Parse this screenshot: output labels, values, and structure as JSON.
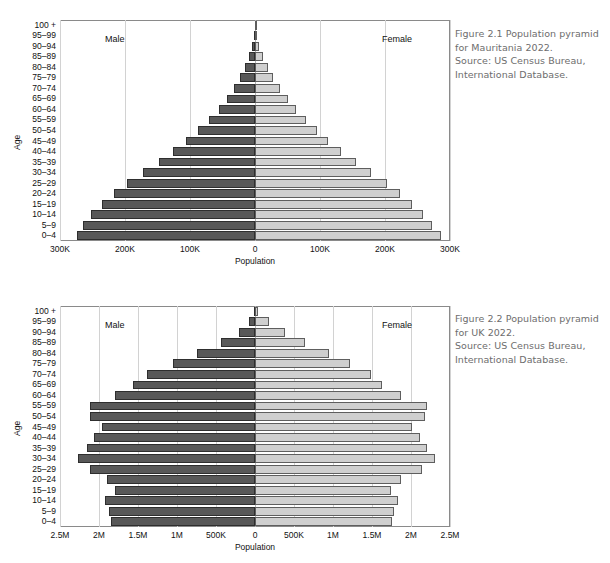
{
  "figures": [
    {
      "id": "figure-1",
      "caption_lines": [
        "Figure 2.1  Population pyramid",
        "for Mauritania 2022.",
        "Source: US Census Bureau,",
        "International Database."
      ],
      "male_label": "Male",
      "female_label": "Female",
      "chart_data": {
        "type": "bar",
        "subtype": "population-pyramid",
        "title": "Population pyramid for Mauritania 2022",
        "xlabel": "Population",
        "ylabel": "Age",
        "xlim": [
          -300000,
          300000
        ],
        "grid": true,
        "legend_position": "inside-top",
        "xticks": [
          {
            "value": -300000,
            "label": "300K"
          },
          {
            "value": -200000,
            "label": "200K"
          },
          {
            "value": -100000,
            "label": "100K"
          },
          {
            "value": 0,
            "label": "0"
          },
          {
            "value": 100000,
            "label": "100K"
          },
          {
            "value": 200000,
            "label": "200K"
          },
          {
            "value": 300000,
            "label": "300K"
          }
        ],
        "categories": [
          "100 +",
          "95–99",
          "90–94",
          "85–89",
          "80–84",
          "75–79",
          "70–74",
          "65–69",
          "60–64",
          "55–59",
          "50–54",
          "45–49",
          "40–44",
          "35–39",
          "30–34",
          "25–29",
          "20–24",
          "15–19",
          "10–14",
          "5–9",
          "0–4"
        ],
        "series": [
          {
            "name": "Male",
            "color": "#585858",
            "values": [
              300,
              1800,
              4600,
              9200,
              15500,
              23000,
              32000,
              43000,
              56000,
              71000,
              88000,
              106000,
              126000,
              148000,
              172000,
              197000,
              217000,
              235000,
              252000,
              264000,
              274000
            ]
          },
          {
            "name": "Female",
            "color": "#cfcfcf",
            "values": [
              500,
              2600,
              6400,
              12000,
              19500,
              28000,
              38000,
              50000,
              63000,
              78000,
              95000,
              113000,
              133000,
              155000,
              179000,
              203000,
              223000,
              241000,
              258000,
              272000,
              286000
            ]
          }
        ]
      }
    },
    {
      "id": "figure-2",
      "caption_lines": [
        "Figure 2.2  Population pyramid",
        "for UK 2022.",
        "Source: US Census Bureau,",
        "International Database."
      ],
      "male_label": "Male",
      "female_label": "Female",
      "chart_data": {
        "type": "bar",
        "subtype": "population-pyramid",
        "title": "Population pyramid for UK 2022",
        "xlabel": "Population",
        "ylabel": "Age",
        "xlim": [
          -2500000,
          2500000
        ],
        "grid": true,
        "legend_position": "inside-top",
        "xticks": [
          {
            "value": -2500000,
            "label": "2.5M"
          },
          {
            "value": -2000000,
            "label": "2M"
          },
          {
            "value": -1500000,
            "label": "1.5M"
          },
          {
            "value": -1000000,
            "label": "1M"
          },
          {
            "value": -500000,
            "label": "500K"
          },
          {
            "value": 0,
            "label": "0"
          },
          {
            "value": 500000,
            "label": "500K"
          },
          {
            "value": 1000000,
            "label": "1M"
          },
          {
            "value": 1500000,
            "label": "1.5M"
          },
          {
            "value": 2000000,
            "label": "2M"
          },
          {
            "value": 2500000,
            "label": "2.5M"
          }
        ],
        "categories": [
          "100 +",
          "95–99",
          "90–94",
          "85–89",
          "80–84",
          "75–79",
          "70–74",
          "65–69",
          "60–64",
          "55–59",
          "50–54",
          "45–49",
          "40–44",
          "35–39",
          "30–34",
          "25–29",
          "20–24",
          "15–19",
          "10–14",
          "5–9",
          "0–4"
        ],
        "series": [
          {
            "name": "Male",
            "color": "#585858",
            "values": [
              10000,
              75000,
              210000,
              430000,
              740000,
              1050000,
              1390000,
              1560000,
              1800000,
              2120000,
              2110000,
              1960000,
              2060000,
              2150000,
              2270000,
              2120000,
              1900000,
              1800000,
              1920000,
              1870000,
              1840000
            ]
          },
          {
            "name": "Female",
            "color": "#cfcfcf",
            "values": [
              40000,
              180000,
              390000,
              640000,
              950000,
              1220000,
              1490000,
              1630000,
              1870000,
              2200000,
              2180000,
              2010000,
              2110000,
              2200000,
              2310000,
              2140000,
              1870000,
              1740000,
              1830000,
              1780000,
              1750000
            ]
          }
        ]
      }
    }
  ]
}
